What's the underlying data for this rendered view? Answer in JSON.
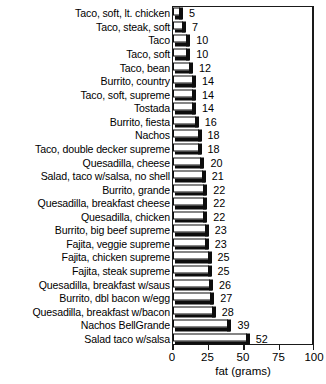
{
  "chart_data": {
    "type": "bar",
    "orientation": "horizontal",
    "title": "",
    "xlabel": "fat (grams)",
    "ylabel": "",
    "xlim": [
      0,
      100
    ],
    "xticks": [
      0,
      25,
      50,
      75,
      100
    ],
    "xtick_labels": [
      "0",
      "25",
      "50",
      "75",
      "100"
    ],
    "grid": false,
    "legend": false,
    "data_labels": true,
    "categories": [
      "Taco, soft, lt. chicken",
      "Taco, steak, soft",
      "Taco",
      "Taco, soft",
      "Taco, bean",
      "Burrito, country",
      "Taco, soft, supreme",
      "Tostada",
      "Burrito, fiesta",
      "Nachos",
      "Taco, double decker supreme",
      "Quesadilla, cheese",
      "Salad, taco w/salsa, no shell",
      "Burrito, grande",
      "Quesadilla, breakfast cheese",
      "Quesadilla, chicken",
      "Burrito, big beef supreme",
      "Fajita, veggie supreme",
      "Fajita, chicken supreme",
      "Fajita, steak supreme",
      "Quesadilla, breakfast w/saus",
      "Burrito, dbl bacon w/egg",
      "Quesadilla, breakfast w/bacon",
      "Nachos BellGrande",
      "Salad taco w/salsa"
    ],
    "values": [
      5,
      7,
      10,
      10,
      12,
      14,
      14,
      14,
      16,
      18,
      18,
      20,
      21,
      22,
      22,
      22,
      23,
      23,
      25,
      25,
      26,
      27,
      28,
      39,
      52
    ],
    "value_labels": [
      "5",
      "7",
      "10",
      "10",
      "12",
      "14",
      "14",
      "14",
      "16",
      "18",
      "18",
      "20",
      "21",
      "22",
      "22",
      "22",
      "23",
      "23",
      "25",
      "25",
      "26",
      "27",
      "28",
      "39",
      "52"
    ],
    "colors": {
      "bar_face": "#ffffff",
      "bar_outline": "#0d0d0d",
      "bar_shadow": "#0d0d0d",
      "axis": "#1a1a1a",
      "text": "#000000",
      "background": "#ffffff"
    }
  }
}
